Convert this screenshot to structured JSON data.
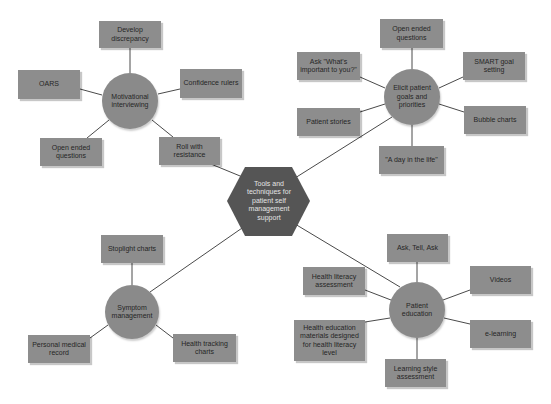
{
  "diagram": {
    "center": {
      "label": "Tools and techniques for patient self management support",
      "color": "#555555"
    },
    "hubs": [
      {
        "id": "motivational",
        "label": "Motivational interviewing",
        "leaves": [
          "Develop discrepancy",
          "OARS",
          "Confidence rulers",
          "Open ended questions",
          "Roll with resistance"
        ]
      },
      {
        "id": "elicit",
        "label": "Elicit patient goals and priorities",
        "leaves": [
          "Open ended questions",
          "Ask \"What's important to you?\"",
          "SMART goal setting",
          "Patient stories",
          "Bubble charts",
          "\"A day in the life\""
        ]
      },
      {
        "id": "symptom",
        "label": "Symptom management",
        "leaves": [
          "Stoplight charts",
          "Personal medical record",
          "Health tracking charts"
        ]
      },
      {
        "id": "education",
        "label": "Patient education",
        "leaves": [
          "Ask, Tell, Ask",
          "Health literacy assessment",
          "Videos",
          "Health education materials designed for health literacy level",
          "e-learning",
          "Learning style assessment"
        ]
      }
    ],
    "colors": {
      "box_fill": "#8d8d8d",
      "circle_fill": "#8a8a8a",
      "line": "#4a4a4a",
      "hex_text": "#e4e4e4"
    }
  }
}
